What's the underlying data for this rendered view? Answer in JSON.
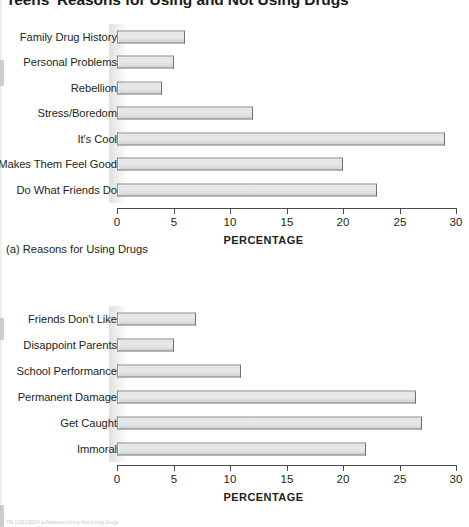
{
  "title": "Teens' Reasons for Using and Not Using Drugs",
  "footer_note": "TM 12/21/2024 a-Reasons-Using-Not-Using-Drugs",
  "axis": {
    "label": "PERCENTAGE",
    "ticks": [
      "0",
      "5",
      "10",
      "15",
      "20",
      "25",
      "30"
    ],
    "min": 0,
    "max": 30
  },
  "captions": {
    "a": "(a) Reasons for Using Drugs"
  },
  "chart_data": [
    {
      "type": "bar",
      "orientation": "horizontal",
      "id": "a",
      "title": "Teens' Reasons for Using and Not Using Drugs",
      "subtitle": "(a) Reasons for Using Drugs",
      "categories": [
        "Family Drug History",
        "Personal Problems",
        "Rebellion",
        "Stress/Boredom",
        "It's Cool",
        "Makes Them Feel Good",
        "Do What Friends Do"
      ],
      "values": [
        6,
        5,
        4,
        12,
        29,
        20,
        23
      ],
      "xlabel": "PERCENTAGE",
      "ylabel": "",
      "xlim": [
        0,
        30
      ],
      "xticks": [
        0,
        5,
        10,
        15,
        20,
        25,
        30
      ],
      "grid": false,
      "legend": false,
      "bar_color": "#e2e2e2",
      "bar_edge_color": "#7a7a7a"
    },
    {
      "type": "bar",
      "orientation": "horizontal",
      "id": "b",
      "subtitle": "",
      "categories": [
        "Friends Don't Like",
        "Disappoint Parents",
        "School Performance",
        "Permanent Damage",
        "Get Caught",
        "Immoral"
      ],
      "values": [
        7,
        5,
        11,
        26.5,
        27,
        22
      ],
      "xlabel": "PERCENTAGE",
      "ylabel": "",
      "xlim": [
        0,
        30
      ],
      "xticks": [
        0,
        5,
        10,
        15,
        20,
        25,
        30
      ],
      "grid": false,
      "legend": false,
      "bar_color": "#e2e2e2",
      "bar_edge_color": "#7a7a7a"
    }
  ]
}
